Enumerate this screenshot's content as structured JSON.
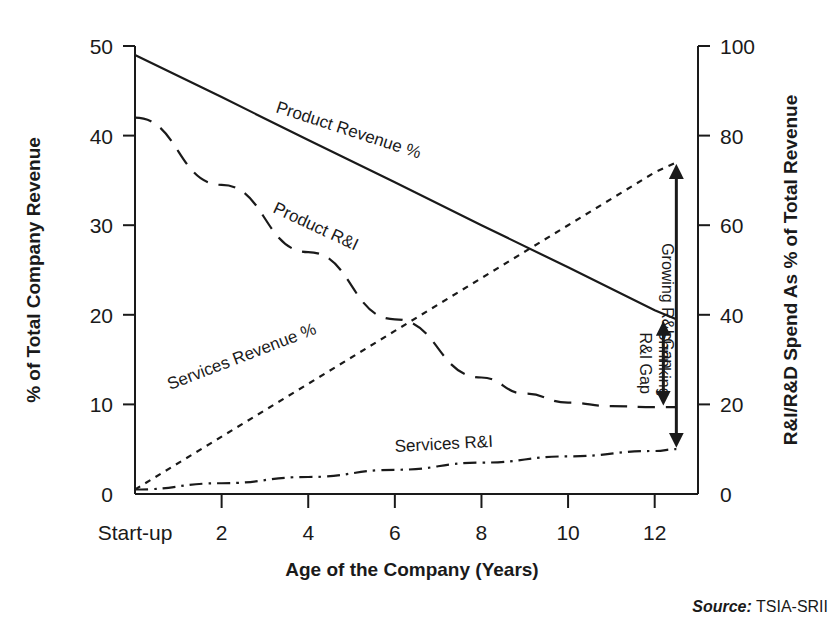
{
  "chart_data": {
    "type": "line",
    "title": "",
    "xlabel": "Age of the Company (Years)",
    "ylabel": "% of Total Company Revenue",
    "y2label": "R&I/R&D Spend As % of Total Revenue",
    "xlim": [
      0,
      13
    ],
    "ylim": [
      0,
      50
    ],
    "y2lim": [
      0,
      100
    ],
    "grid": false,
    "legend_position": "inline-labels",
    "x_tick_labels": [
      "Start-up",
      "2",
      "4",
      "6",
      "8",
      "10",
      "12"
    ],
    "x_tick_values": [
      0,
      2,
      4,
      6,
      8,
      10,
      12
    ],
    "y_tick_labels": [
      "0",
      "10",
      "20",
      "30",
      "40",
      "50"
    ],
    "y_tick_values": [
      0,
      10,
      20,
      30,
      40,
      50
    ],
    "y2_tick_labels": [
      "0",
      "20",
      "40",
      "60",
      "80",
      "100"
    ],
    "y2_tick_values": [
      0,
      20,
      40,
      60,
      80,
      100
    ],
    "series": [
      {
        "name": "Product Revenue %",
        "style": "solid",
        "axis": "left",
        "x": [
          0,
          2,
          4,
          6,
          8,
          10,
          12,
          12.5
        ],
        "values": [
          49,
          44.3,
          39.5,
          34.8,
          30,
          25.3,
          20.5,
          19.5
        ]
      },
      {
        "name": "Product R&I",
        "style": "dashed",
        "axis": "left",
        "x": [
          0,
          2,
          4,
          6,
          8,
          9,
          10,
          11,
          12,
          12.5
        ],
        "values": [
          42,
          34.5,
          27,
          19.5,
          13,
          11.2,
          10.2,
          9.8,
          9.7,
          9.7
        ]
      },
      {
        "name": "Services Revenue %",
        "style": "dotted",
        "axis": "left",
        "x": [
          0,
          2,
          4,
          6,
          8,
          10,
          12,
          12.5
        ],
        "values": [
          0.5,
          6.4,
          12.3,
          18.2,
          24.1,
          30,
          35.9,
          37
        ]
      },
      {
        "name": "Services R&I",
        "style": "dashdot",
        "axis": "left",
        "x": [
          0,
          2,
          4,
          6,
          8,
          10,
          12,
          12.5
        ],
        "values": [
          0.5,
          1.2,
          1.9,
          2.7,
          3.5,
          4.2,
          4.8,
          5
        ]
      }
    ],
    "annotations": [
      {
        "label": "Growing R&I Gap",
        "x": 12.5,
        "y_from": 5,
        "y_to": 37,
        "arrow": "double"
      },
      {
        "label": "Shrinking R&I Gap",
        "x": 12.2,
        "y_from": 9.7,
        "y_to": 19.5,
        "arrow": "double"
      }
    ],
    "series_inline_labels": [
      {
        "text": "Product Revenue %",
        "x": 275,
        "y": 112,
        "rotate": 18
      },
      {
        "text": "Product R&I",
        "x": 272,
        "y": 212,
        "rotate": 25
      },
      {
        "text": "Services Revenue %",
        "x": 170,
        "y": 390,
        "rotate": -21
      },
      {
        "text": "Services R&I",
        "x": 395,
        "y": 452,
        "rotate": -3
      }
    ]
  },
  "source": {
    "prefix": "Source:",
    "value": " TSIA-SRII"
  },
  "colors": {
    "ink": "#1a1a1a",
    "background": "#ffffff"
  }
}
